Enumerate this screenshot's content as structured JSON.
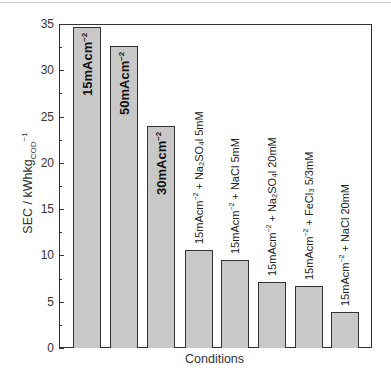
{
  "chart_data": {
    "type": "bar",
    "title": "",
    "xlabel": "Conditions",
    "ylabel": "SEC / kWhkg_COD^-1",
    "ylim": [
      0,
      35
    ],
    "yticks": [
      0,
      5,
      10,
      15,
      20,
      25,
      30,
      35
    ],
    "grid": false,
    "legend": null,
    "categories": [
      "15mAcm-2",
      "50mAcm-2",
      "30mAcm-2",
      "15mAcm-2 + Na2SO4 5mM",
      "15mAcm-2 + NaCl 5mM",
      "15mAcm-2 + Na2SO4 20mM",
      "15mAcm-2 + FeCl3 5/3mM",
      "15mAcm-2 + NaCl 20mM"
    ],
    "values": [
      34.7,
      32.6,
      24.0,
      10.6,
      9.5,
      7.1,
      6.7,
      3.9
    ],
    "bar_color": "#c8c8c8",
    "edge_color": "#333333"
  },
  "axis": {
    "ylabel_main": "SEC / kWhkg",
    "ylabel_sub": "COD",
    "ylabel_sup": "−1",
    "xlabel": "Conditions",
    "yticks": [
      "0",
      "5",
      "10",
      "15",
      "20",
      "25",
      "30",
      "35"
    ]
  },
  "labels": [
    {
      "base": "15mAcm",
      "sup": "−2",
      "rest": "",
      "inside": true
    },
    {
      "base": "50mAcm",
      "sup": "−2",
      "rest": "",
      "inside": true
    },
    {
      "base": "30mAcm",
      "sup": "−2",
      "rest": "",
      "inside": true
    },
    {
      "base": "15mAcm",
      "sup": "−2",
      "rest": " + Na₂SO₄l 5mM",
      "inside": false
    },
    {
      "base": "15mAcm",
      "sup": "−2",
      "rest": " + NaCl 5mM",
      "inside": false
    },
    {
      "base": "15mAcm",
      "sup": "−2",
      "rest": " + Na₂SO₄l 20mM",
      "inside": false
    },
    {
      "base": "15mAcm",
      "sup": "−2",
      "rest": " + FeCl₃ 5/3mM",
      "inside": false
    },
    {
      "base": "15mAcm",
      "sup": "−2",
      "rest": " + NaCl 20mM",
      "inside": false
    }
  ]
}
